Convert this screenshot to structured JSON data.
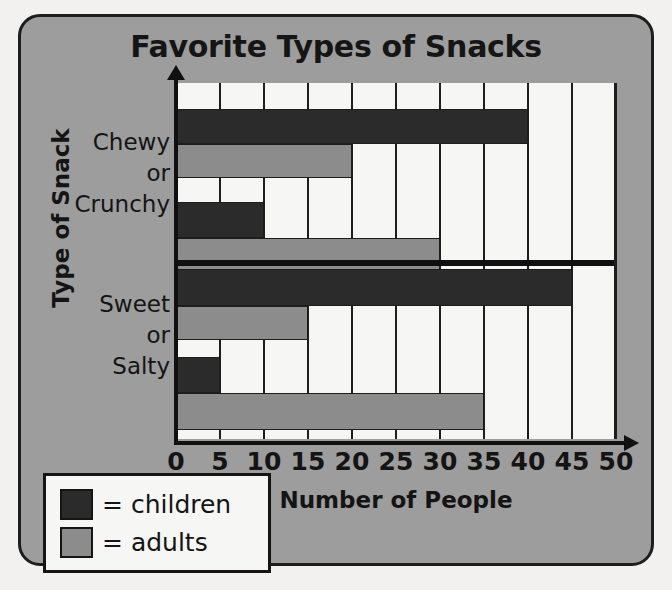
{
  "chart_data": {
    "type": "bar",
    "orientation": "horizontal",
    "title": "Favorite Types of Snacks",
    "xlabel": "Number of People",
    "ylabel": "Type of Snack",
    "xlim": [
      0,
      50
    ],
    "xticks": [
      0,
      5,
      10,
      15,
      20,
      25,
      30,
      35,
      40,
      45,
      50
    ],
    "xtick_labels": [
      "0",
      "5",
      "10",
      "15",
      "20",
      "25",
      "30",
      "35",
      "40",
      "45",
      "50"
    ],
    "grid": true,
    "legend_position": "bottom-left",
    "legend": [
      {
        "label": "= children",
        "name": "children",
        "color": "#2b2b2b"
      },
      {
        "label": "= adults",
        "name": "adults",
        "color": "#8c8c8c"
      }
    ],
    "categories": [
      {
        "lines": [
          "Chewy",
          "or",
          "Crunchy"
        ]
      },
      {
        "lines": [
          "Sweet",
          "or",
          "Salty"
        ]
      }
    ],
    "groups": [
      {
        "category": "Chewy or Crunchy",
        "bars": [
          {
            "series": "children",
            "value": 40
          },
          {
            "series": "adults",
            "value": 20
          },
          {
            "series": "children",
            "value": 10
          },
          {
            "series": "adults",
            "value": 30
          }
        ]
      },
      {
        "category": "Sweet or Salty",
        "bars": [
          {
            "series": "children",
            "value": 45
          },
          {
            "series": "adults",
            "value": 15
          },
          {
            "series": "children",
            "value": 5
          },
          {
            "series": "adults",
            "value": 35
          }
        ]
      }
    ]
  },
  "colors": {
    "panel": "#9d9d9d",
    "plot_background": "#f6f6f4",
    "ink": "#151515",
    "children": "#2b2b2b",
    "adults": "#8c8c8c"
  }
}
